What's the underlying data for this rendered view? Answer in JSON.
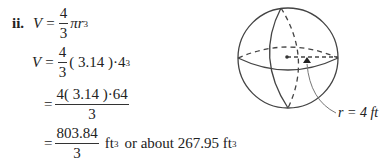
{
  "problem": {
    "label": "ii.",
    "line1": {
      "lhs": "V",
      "eq": "=",
      "num": "4",
      "den": "3",
      "rest": "πr",
      "exp": "3"
    },
    "line2": {
      "lhs": "V",
      "eq": "=",
      "num": "4",
      "den": "3",
      "rest": "( 3.14 )·4",
      "exp": "3"
    },
    "line3": {
      "eq": "=",
      "num": "4( 3.14 )·64",
      "den": "3"
    },
    "line4": {
      "eq": "=",
      "num": "803.84",
      "den": "3",
      "unit": "ft",
      "exp": "3",
      "tail": "or about 267.95 ft",
      "tail_exp": "3"
    }
  },
  "figure": {
    "name": "sphere",
    "radius_label": "r = 4 ft"
  }
}
